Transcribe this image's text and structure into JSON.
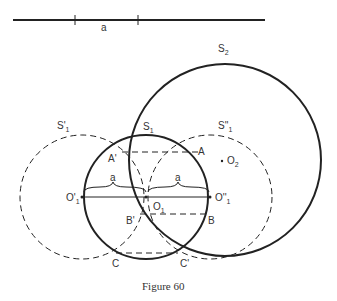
{
  "caption": "Figure 60",
  "segment_label": "a",
  "labels": {
    "S2": "S",
    "S2_sub": "2",
    "S1": "S",
    "S1_sub": "1",
    "S1p": "S'",
    "S1p_sub": "1",
    "S1pp": "S''",
    "S1pp_sub": "1",
    "A": "A",
    "Ap": "A'",
    "B": "B",
    "Bp": "B'",
    "C": "C",
    "Cp": "C'",
    "O2": "O",
    "O2_sub": "2",
    "O1": "O",
    "O1_sub": "1",
    "O1p": "O'",
    "O1p_sub": "1",
    "O1pp": "O''",
    "O1pp_sub": "1",
    "a_left": "a",
    "a_right": "a"
  }
}
